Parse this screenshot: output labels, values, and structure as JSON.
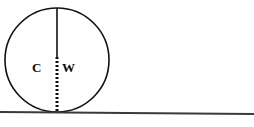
{
  "figure": {
    "type": "geometry-diagram",
    "background_color": "#ffffff",
    "stroke_color": "#111111",
    "ground_line_color": "#3a3a3a"
  },
  "labels": {
    "left": "C",
    "right": "W"
  },
  "geometry": {
    "circle": {
      "center_x": 57,
      "center_y": 60,
      "radius": 52,
      "stroke_width": 1.6,
      "fill": "none"
    },
    "vertical_line": {
      "x": 57,
      "top_y": 8,
      "solid_end_y": 58,
      "bottom_y": 113,
      "solid_stroke_width": 1.6,
      "dashed_stroke_width": 3,
      "dash_pattern": "2 2"
    },
    "ground_line": {
      "x1": 0,
      "y1": 112,
      "x2": 254,
      "y2": 114,
      "stroke_width": 1.8
    }
  }
}
